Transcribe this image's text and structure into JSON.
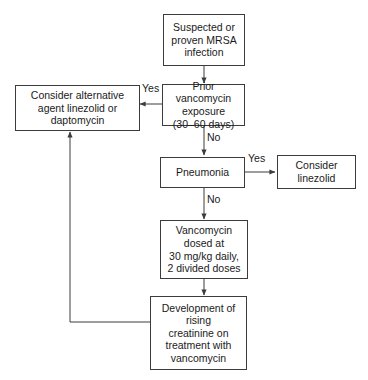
{
  "diagram": {
    "stroke_color": "#3c3c3c",
    "text_color": "#1a1a1a",
    "background": "#ffffff",
    "nodes": [
      {
        "id": "suspected",
        "label": "Suspected or\nproven MRSA\ninfection"
      },
      {
        "id": "prior_exposure",
        "label": "Prior vancomycin\nexposure\n(30–60 days)"
      },
      {
        "id": "alternative_agent",
        "label": "Consider alternative\nagent linezolid or\ndaptomycin"
      },
      {
        "id": "pneumonia",
        "label": "Pneumonia"
      },
      {
        "id": "consider_linezolid",
        "label": "Consider\nlinezolid"
      },
      {
        "id": "vancomycin_dose",
        "label": "Vancomycin\ndosed at\n30 mg/kg daily,\n2 divided doses"
      },
      {
        "id": "rising_creatinine",
        "label": "Development of\nrising\ncreatinine on\ntreatment with\nvancomycin"
      }
    ],
    "edge_labels": {
      "exposure_yes": "Yes",
      "exposure_no": "No",
      "pneumonia_yes": "Yes",
      "pneumonia_no": "No"
    }
  }
}
